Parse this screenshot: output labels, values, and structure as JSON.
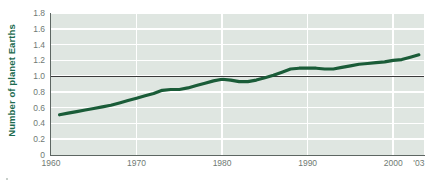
{
  "chart_data": {
    "type": "line",
    "title": "",
    "subtitle": "",
    "xlabel": "",
    "ylabel": "Number of planet Earths",
    "xlim": [
      1960,
      2003.6
    ],
    "ylim": [
      0,
      1.8
    ],
    "grid": true,
    "legend": null,
    "line_color": "#1a5c38",
    "plot_background": "#dfe6e1",
    "gridline_color": "#ffffff",
    "axis_color": "#5d6662",
    "label_color": "#1d6b4f",
    "tick_label_color": "#6f7a74",
    "reference_lines": [
      {
        "name": "one-planet-earth",
        "axis": "y",
        "value": 1.0,
        "color": "#3a3a3a"
      }
    ],
    "x_ticks": [
      1960,
      1970,
      1980,
      1990,
      2000,
      2003
    ],
    "x_tick_labels": [
      "1960",
      "1970",
      "1980",
      "1990",
      "2000",
      "'03"
    ],
    "y_ticks": [
      0,
      0.2,
      0.4,
      0.6,
      0.8,
      1.0,
      1.2,
      1.4,
      1.6,
      1.8
    ],
    "y_tick_labels": [
      "0",
      "0.2",
      "0.4",
      "0.6",
      "0.8",
      "1.0",
      "1.2",
      "1.4",
      "1.6",
      "1.8"
    ],
    "x": [
      1961,
      1962,
      1963,
      1964,
      1965,
      1966,
      1967,
      1968,
      1969,
      1970,
      1971,
      1972,
      1973,
      1974,
      1975,
      1976,
      1977,
      1978,
      1979,
      1980,
      1981,
      1982,
      1983,
      1984,
      1985,
      1986,
      1987,
      1988,
      1989,
      1990,
      1991,
      1992,
      1993,
      1994,
      1995,
      1996,
      1997,
      1998,
      1999,
      2000,
      2001,
      2002,
      2003
    ],
    "values": [
      0.51,
      0.53,
      0.55,
      0.57,
      0.59,
      0.61,
      0.63,
      0.66,
      0.69,
      0.72,
      0.75,
      0.78,
      0.82,
      0.83,
      0.83,
      0.85,
      0.88,
      0.91,
      0.94,
      0.96,
      0.95,
      0.93,
      0.93,
      0.95,
      0.98,
      1.01,
      1.05,
      1.09,
      1.1,
      1.1,
      1.1,
      1.09,
      1.09,
      1.11,
      1.13,
      1.15,
      1.16,
      1.17,
      1.18,
      1.2,
      1.21,
      1.24,
      1.27
    ]
  }
}
